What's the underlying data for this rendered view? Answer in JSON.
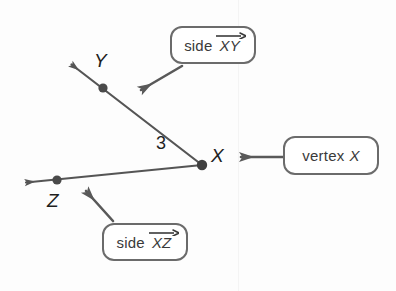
{
  "figure": {
    "type": "geometry-diagram",
    "background_color": "#fdfdfd",
    "stroke_color": "#555555",
    "callout_border_color": "#6b6b6b",
    "label_color": "#1f1f1f"
  },
  "points": [
    {
      "name": "X",
      "label": "X",
      "role": "vertex",
      "x": 202,
      "y": 165
    },
    {
      "name": "Y",
      "label": "Y",
      "role": "ray-point",
      "x": 103,
      "y": 88
    },
    {
      "name": "Z",
      "label": "Z",
      "role": "ray-point",
      "x": 57,
      "y": 180
    }
  ],
  "rays": [
    {
      "name": "ray-XY",
      "from": "X",
      "through": "Y",
      "tip_x": 68,
      "tip_y": 62
    },
    {
      "name": "ray-XZ",
      "from": "X",
      "through": "Z",
      "tip_x": 22,
      "tip_y": 183
    }
  ],
  "measure": {
    "label": "3",
    "x": 163,
    "y": 147
  },
  "callouts": [
    {
      "id": "side-xy",
      "prefix": "side",
      "symbol": "XY",
      "overbar": "ray",
      "pointer_tip_x": 137,
      "pointer_tip_y": 93
    },
    {
      "id": "vertex-x",
      "prefix": "vertex",
      "symbol": "X",
      "overbar": "none",
      "pointer_tip_x": 237,
      "pointer_tip_y": 157
    },
    {
      "id": "side-xz",
      "prefix": "side",
      "symbol": "XZ",
      "overbar": "ray",
      "pointer_tip_x": 82,
      "pointer_tip_y": 188
    }
  ]
}
